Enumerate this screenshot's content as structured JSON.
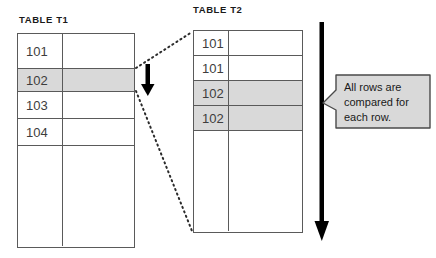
{
  "diagram": {
    "title_t1": "TABLE T1",
    "title_t2": "TABLE T2",
    "callout_line1": "All rows are",
    "callout_line2": "compared for",
    "callout_line3": "each row.",
    "colors": {
      "shade": "#d9d9d9",
      "border": "#5a5a5a",
      "arrow": "#000000",
      "callout_fill": "#d9d9d9",
      "background": "#ffffff"
    }
  },
  "table_t1": {
    "label": "TABLE T1",
    "rows": [
      {
        "key": "101",
        "value": "",
        "shaded": false
      },
      {
        "key": "102",
        "value": "",
        "shaded": true
      },
      {
        "key": "103",
        "value": "",
        "shaded": false
      },
      {
        "key": "104",
        "value": "",
        "shaded": false
      },
      {
        "key": "",
        "value": "",
        "shaded": false
      }
    ]
  },
  "table_t2": {
    "label": "TABLE T2",
    "rows": [
      {
        "key": "101",
        "value": "",
        "shaded": false
      },
      {
        "key": "101",
        "value": "",
        "shaded": false
      },
      {
        "key": "102",
        "value": "",
        "shaded": true
      },
      {
        "key": "102",
        "value": "",
        "shaded": true
      },
      {
        "key": "",
        "value": "",
        "shaded": false
      }
    ]
  },
  "annotations": {
    "down_arrow_small": "down-arrow",
    "down_arrow_large": "down-arrow-large",
    "connector_top": "dashed-connector",
    "connector_bottom": "dashed-connector"
  }
}
